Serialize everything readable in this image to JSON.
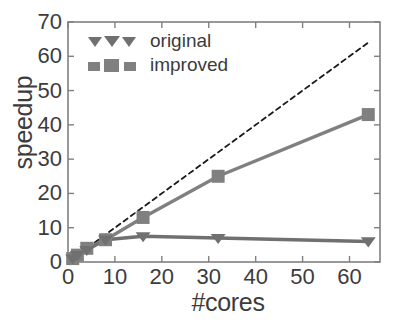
{
  "chart_data": {
    "type": "line",
    "title": "",
    "xlabel": "#cores",
    "ylabel": "speedup",
    "xlim": [
      0,
      66.5
    ],
    "ylim": [
      0,
      70
    ],
    "grid": false,
    "legend_position": "top-left-inside",
    "xticks": [
      "0",
      "10",
      "20",
      "30",
      "40",
      "50",
      "60"
    ],
    "xtick_values": [
      0,
      10,
      20,
      30,
      40,
      50,
      60
    ],
    "yticks": [
      "0",
      "10",
      "20",
      "30",
      "40",
      "50",
      "60",
      "70"
    ],
    "ytick_values": [
      0,
      10,
      20,
      30,
      40,
      50,
      60,
      70
    ],
    "x": [
      1,
      2,
      4,
      8,
      16,
      32,
      64
    ],
    "series": [
      {
        "name": "ideal",
        "marker": "none",
        "linestyle": "dashed",
        "color": "#1a1a1a",
        "x": [
          1,
          64
        ],
        "values": [
          1,
          64
        ],
        "in_legend": false
      },
      {
        "name": "improved",
        "marker": "square",
        "linestyle": "solid",
        "color": "#808080",
        "x": [
          1,
          2,
          4,
          8,
          16,
          32,
          64
        ],
        "values": [
          1,
          2,
          4,
          6.5,
          13,
          25,
          43
        ],
        "in_legend": true
      },
      {
        "name": "original",
        "marker": "triangle-down",
        "linestyle": "solid",
        "color": "#707070",
        "x": [
          1,
          2,
          4,
          8,
          16,
          32,
          64
        ],
        "values": [
          1,
          2,
          3.5,
          6.5,
          7.5,
          7,
          6
        ],
        "in_legend": true
      }
    ]
  },
  "legend": {
    "entries": [
      {
        "label": "original",
        "marker": "triangle-down-icon",
        "color": "#707070"
      },
      {
        "label": "improved",
        "marker": "square-icon",
        "color": "#808080"
      }
    ]
  },
  "colors": {
    "axis": "#808080",
    "text": "#3c3c3c",
    "improved": "#808080",
    "original": "#707070",
    "ideal": "#1a1a1a",
    "background": "#ffffff"
  }
}
